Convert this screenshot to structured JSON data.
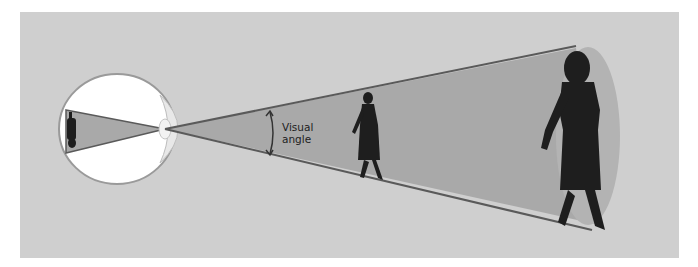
{
  "diagram": {
    "labels": {
      "visual_angle_line1": "Visual",
      "visual_angle_line2": "angle"
    },
    "elements": [
      "eye-cross-section",
      "lens",
      "retinal-image-inverted",
      "light-cone",
      "near-figure-woman",
      "far-figure-woman"
    ],
    "colors": {
      "background": "#cfcfcf",
      "cone_fill": "#a9a9a9",
      "cone_edge": "#5a5a5a",
      "eye_white": "#ffffff",
      "silhouette": "#1e1e1e",
      "end_ellipse": "#b3b3b3"
    }
  }
}
